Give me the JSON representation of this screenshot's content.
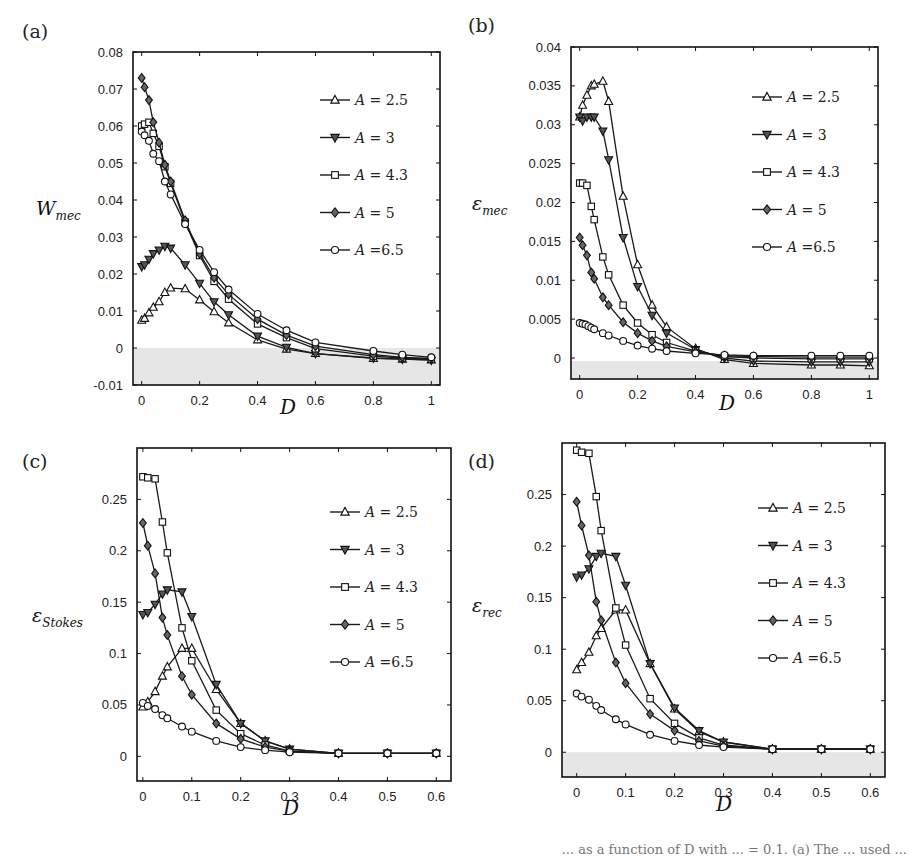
{
  "figure": {
    "caption_fragment": "... as a function of D with ... = 0.1. (a) The ... used ...",
    "legend": [
      {
        "label": "A = 2.5",
        "var": "A",
        "value": "= 2.5",
        "marker": "triangle-up",
        "fill": "#ffffff"
      },
      {
        "label": "A = 3",
        "var": "A",
        "value": "= 3",
        "marker": "triangle-down",
        "fill": "#555555"
      },
      {
        "label": "A = 4.3",
        "var": "A",
        "value": "= 4.3",
        "marker": "square",
        "fill": "#ffffff"
      },
      {
        "label": "A = 5",
        "var": "A",
        "value": "= 5",
        "marker": "diamond",
        "fill": "#666666"
      },
      {
        "label": "A =6.5",
        "var": "A",
        "value": "=6.5",
        "marker": "circle",
        "fill": "#ffffff"
      }
    ],
    "colors": {
      "line": "#1a1a1a",
      "shade": "#e6e6e6",
      "axis": "#111111"
    }
  },
  "chart_data": [
    {
      "panel": "(a)",
      "type": "line",
      "xlabel": "D",
      "ylabel": "W_mec",
      "ylabel_main": "W",
      "ylabel_sub": "mec",
      "xlim": [
        -0.03,
        1.03
      ],
      "ylim": [
        -0.01,
        0.08
      ],
      "xticks": [
        0,
        0.2,
        0.4,
        0.6,
        0.8,
        1
      ],
      "xtick_labels": [
        "0",
        "0.2",
        "0.4",
        "0.6",
        "0.8",
        "1"
      ],
      "yticks": [
        -0.01,
        0,
        0.01,
        0.02,
        0.03,
        0.04,
        0.05,
        0.06,
        0.07,
        0.08
      ],
      "ytick_labels": [
        "-0.01",
        "0",
        "0.01",
        "0.02",
        "0.03",
        "0.04",
        "0.05",
        "0.06",
        "0.07",
        "0.08"
      ],
      "shade_below": 0,
      "legend_position": "upper right",
      "box": {
        "x0": 133,
        "x1": 440,
        "y0": 52,
        "y1": 385
      },
      "series": [
        {
          "name": "A = 2.5",
          "x": [
            0,
            0.01,
            0.025,
            0.04,
            0.06,
            0.08,
            0.1,
            0.15,
            0.2,
            0.25,
            0.3,
            0.4,
            0.5,
            0.6,
            0.8,
            0.9,
            1.0
          ],
          "y": [
            0.0075,
            0.008,
            0.0095,
            0.011,
            0.0125,
            0.015,
            0.0162,
            0.016,
            0.013,
            0.0098,
            0.0068,
            0.0022,
            -0.0003,
            -0.0015,
            -0.0028,
            -0.003,
            -0.0032
          ]
        },
        {
          "name": "A = 3",
          "x": [
            0,
            0.01,
            0.025,
            0.04,
            0.06,
            0.08,
            0.1,
            0.15,
            0.2,
            0.25,
            0.3,
            0.4,
            0.5,
            0.6,
            0.8,
            0.9,
            1.0
          ],
          "y": [
            0.022,
            0.0225,
            0.024,
            0.0255,
            0.0265,
            0.0275,
            0.027,
            0.0225,
            0.0175,
            0.0125,
            0.009,
            0.0032,
            0.0002,
            -0.0015,
            -0.0027,
            -0.003,
            -0.0033
          ]
        },
        {
          "name": "A = 4.3",
          "x": [
            0,
            0.01,
            0.025,
            0.04,
            0.06,
            0.08,
            0.1,
            0.15,
            0.2,
            0.25,
            0.3,
            0.4,
            0.5,
            0.6,
            0.8,
            0.9,
            1.0
          ],
          "y": [
            0.06,
            0.0605,
            0.061,
            0.058,
            0.0545,
            0.049,
            0.0445,
            0.034,
            0.025,
            0.018,
            0.0132,
            0.0065,
            0.0028,
            -0.0002,
            -0.0022,
            -0.0027,
            -0.003
          ]
        },
        {
          "name": "A = 5",
          "x": [
            0,
            0.01,
            0.025,
            0.04,
            0.06,
            0.08,
            0.1,
            0.15,
            0.2,
            0.25,
            0.3,
            0.4,
            0.5,
            0.6,
            0.8,
            0.9,
            1.0
          ],
          "y": [
            0.073,
            0.0705,
            0.067,
            0.061,
            0.0555,
            0.0495,
            0.045,
            0.0345,
            0.0255,
            0.019,
            0.0145,
            0.0078,
            0.0035,
            0.0005,
            -0.0018,
            -0.0025,
            -0.0028
          ]
        },
        {
          "name": "A =6.5",
          "x": [
            0,
            0.01,
            0.025,
            0.04,
            0.06,
            0.08,
            0.1,
            0.15,
            0.2,
            0.25,
            0.3,
            0.4,
            0.5,
            0.6,
            0.8,
            0.9,
            1.0
          ],
          "y": [
            0.0585,
            0.0575,
            0.056,
            0.0525,
            0.0505,
            0.045,
            0.0415,
            0.0335,
            0.0265,
            0.0205,
            0.0158,
            0.0092,
            0.0048,
            0.0015,
            -0.0008,
            -0.0018,
            -0.0025
          ]
        }
      ]
    },
    {
      "panel": "(b)",
      "type": "line",
      "xlabel": "D",
      "ylabel": "ε_mec",
      "ylabel_main": "ε",
      "ylabel_sub": "mec",
      "xlim": [
        -0.03,
        1.03
      ],
      "ylim": [
        -0.0027,
        0.04
      ],
      "xticks": [
        0,
        0.2,
        0.4,
        0.6,
        0.8,
        1
      ],
      "xtick_labels": [
        "0",
        "0.2",
        "0.4",
        "0.6",
        "0.8",
        "1"
      ],
      "yticks": [
        0,
        0.005,
        0.01,
        0.015,
        0.02,
        0.025,
        0.03,
        0.035,
        0.04
      ],
      "ytick_labels": [
        "0",
        "0.005",
        "0.01",
        "0.015",
        "0.02",
        "0.025",
        "0.03",
        "0.035",
        "0.04"
      ],
      "shade_below": -0.0004,
      "legend_position": "upper right",
      "box": {
        "x0": 571,
        "x1": 878,
        "y0": 47,
        "y1": 379
      },
      "series": [
        {
          "name": "A = 2.5",
          "x": [
            0,
            0.01,
            0.025,
            0.04,
            0.05,
            0.08,
            0.1,
            0.15,
            0.2,
            0.25,
            0.3,
            0.4,
            0.5,
            0.6,
            0.8,
            0.9,
            1.0
          ],
          "y": [
            0.031,
            0.0325,
            0.0338,
            0.035,
            0.0352,
            0.0356,
            0.033,
            0.0208,
            0.012,
            0.0068,
            0.004,
            0.0012,
            -0.0002,
            -0.0007,
            -0.0009,
            -0.0009,
            -0.001
          ]
        },
        {
          "name": "A = 3",
          "x": [
            0,
            0.01,
            0.025,
            0.04,
            0.05,
            0.08,
            0.1,
            0.15,
            0.2,
            0.25,
            0.3,
            0.4,
            0.5,
            0.6,
            0.8,
            0.9,
            1.0
          ],
          "y": [
            0.031,
            0.0305,
            0.031,
            0.031,
            0.031,
            0.0292,
            0.0255,
            0.0155,
            0.0092,
            0.0055,
            0.0032,
            0.0011,
            0.0,
            -0.0004,
            -0.0005,
            -0.0005,
            -0.0005
          ]
        },
        {
          "name": "A = 4.3",
          "x": [
            0,
            0.01,
            0.025,
            0.04,
            0.05,
            0.08,
            0.1,
            0.15,
            0.2,
            0.25,
            0.3,
            0.4,
            0.5,
            0.6,
            0.8,
            0.9,
            1.0
          ],
          "y": [
            0.0225,
            0.0225,
            0.0222,
            0.0195,
            0.0178,
            0.013,
            0.0107,
            0.0068,
            0.0045,
            0.003,
            0.002,
            0.0009,
            0.0002,
            0.0,
            -0.0001,
            -0.0001,
            -0.0001
          ]
        },
        {
          "name": "A = 5",
          "x": [
            0,
            0.01,
            0.025,
            0.04,
            0.05,
            0.08,
            0.1,
            0.15,
            0.2,
            0.25,
            0.3,
            0.4,
            0.5,
            0.6,
            0.8,
            0.9,
            1.0
          ],
          "y": [
            0.0155,
            0.0145,
            0.0132,
            0.011,
            0.0102,
            0.0078,
            0.0068,
            0.0046,
            0.0032,
            0.0022,
            0.0015,
            0.0008,
            0.0003,
            0.0002,
            0.0001,
            0.0001,
            0.0001
          ]
        },
        {
          "name": "A =6.5",
          "x": [
            0,
            0.01,
            0.02,
            0.03,
            0.04,
            0.05,
            0.08,
            0.1,
            0.15,
            0.2,
            0.25,
            0.3,
            0.4,
            0.5,
            0.6,
            0.8,
            0.9,
            1.0
          ],
          "y": [
            0.0045,
            0.0044,
            0.0043,
            0.0041,
            0.0039,
            0.0037,
            0.0032,
            0.0029,
            0.0022,
            0.0016,
            0.0012,
            0.0009,
            0.0006,
            0.0004,
            0.0003,
            0.0003,
            0.0003,
            0.0003
          ]
        }
      ]
    },
    {
      "panel": "(c)",
      "type": "line",
      "xlabel": "D",
      "ylabel": "ε_Stokes",
      "ylabel_main": "ε",
      "ylabel_sub": "Stokes",
      "xlim": [
        -0.012,
        0.63
      ],
      "ylim": [
        -0.024,
        0.3
      ],
      "xticks": [
        0,
        0.1,
        0.2,
        0.3,
        0.4,
        0.5,
        0.6
      ],
      "xtick_labels": [
        "0",
        "0.1",
        "0.2",
        "0.3",
        "0.4",
        "0.5",
        "0.6"
      ],
      "yticks": [
        0,
        0.05,
        0.1,
        0.15,
        0.2,
        0.25
      ],
      "ytick_labels": [
        "0",
        "0.05",
        "0.1",
        "0.15",
        "0.2",
        "0.25"
      ],
      "shade_below": null,
      "legend_position": "upper right",
      "box": {
        "x0": 137,
        "x1": 451,
        "y0": 448,
        "y1": 781
      },
      "series": [
        {
          "name": "A = 2.5",
          "x": [
            0,
            0.01,
            0.025,
            0.04,
            0.05,
            0.08,
            0.1,
            0.15,
            0.2,
            0.25,
            0.3,
            0.4,
            0.5,
            0.6
          ],
          "y": [
            0.048,
            0.053,
            0.063,
            0.078,
            0.087,
            0.105,
            0.105,
            0.065,
            0.032,
            0.015,
            0.007,
            0.003,
            0.003,
            0.003
          ]
        },
        {
          "name": "A = 3",
          "x": [
            0,
            0.01,
            0.025,
            0.04,
            0.05,
            0.08,
            0.1,
            0.15,
            0.2,
            0.25,
            0.3,
            0.4,
            0.5,
            0.6
          ],
          "y": [
            0.138,
            0.14,
            0.148,
            0.158,
            0.162,
            0.16,
            0.136,
            0.07,
            0.032,
            0.015,
            0.007,
            0.003,
            0.003,
            0.003
          ]
        },
        {
          "name": "A = 4.3",
          "x": [
            0,
            0.01,
            0.025,
            0.04,
            0.05,
            0.08,
            0.1,
            0.15,
            0.2,
            0.25,
            0.3,
            0.4,
            0.5,
            0.6
          ],
          "y": [
            0.272,
            0.271,
            0.27,
            0.228,
            0.198,
            0.125,
            0.093,
            0.045,
            0.022,
            0.011,
            0.005,
            0.003,
            0.003,
            0.003
          ]
        },
        {
          "name": "A = 5",
          "x": [
            0,
            0.01,
            0.025,
            0.04,
            0.05,
            0.08,
            0.1,
            0.15,
            0.2,
            0.25,
            0.3,
            0.4,
            0.5,
            0.6
          ],
          "y": [
            0.227,
            0.205,
            0.178,
            0.135,
            0.118,
            0.078,
            0.06,
            0.032,
            0.017,
            0.009,
            0.005,
            0.003,
            0.003,
            0.003
          ]
        },
        {
          "name": "A =6.5",
          "x": [
            0,
            0.01,
            0.025,
            0.04,
            0.05,
            0.08,
            0.1,
            0.15,
            0.2,
            0.25,
            0.3,
            0.4,
            0.5,
            0.6
          ],
          "y": [
            0.052,
            0.049,
            0.046,
            0.04,
            0.037,
            0.029,
            0.024,
            0.015,
            0.009,
            0.006,
            0.004,
            0.003,
            0.003,
            0.003
          ]
        }
      ]
    },
    {
      "panel": "(d)",
      "type": "line",
      "xlabel": "D",
      "ylabel": "ε_rec",
      "ylabel_main": "ε",
      "ylabel_sub": "rec",
      "xlim": [
        -0.03,
        0.63
      ],
      "ylim": [
        -0.024,
        0.3
      ],
      "xticks": [
        0,
        0.1,
        0.2,
        0.3,
        0.4,
        0.5,
        0.6
      ],
      "xtick_labels": [
        "0",
        "0.1",
        "0.2",
        "0.3",
        "0.4",
        "0.5",
        "0.6"
      ],
      "yticks": [
        0,
        0.05,
        0.1,
        0.15,
        0.2,
        0.25
      ],
      "ytick_labels": [
        "0",
        "0.05",
        "0.1",
        "0.15",
        "0.2",
        "0.25"
      ],
      "shade_below": 0,
      "legend_position": "upper right",
      "box": {
        "x0": 562,
        "x1": 885,
        "y0": 443,
        "y1": 777
      },
      "series": [
        {
          "name": "A = 2.5",
          "x": [
            0,
            0.01,
            0.025,
            0.04,
            0.05,
            0.08,
            0.1,
            0.15,
            0.2,
            0.25,
            0.3,
            0.4,
            0.5,
            0.6
          ],
          "y": [
            0.08,
            0.087,
            0.097,
            0.113,
            0.12,
            0.138,
            0.138,
            0.086,
            0.042,
            0.02,
            0.01,
            0.003,
            0.003,
            0.003
          ]
        },
        {
          "name": "A = 3",
          "x": [
            0,
            0.01,
            0.025,
            0.04,
            0.05,
            0.08,
            0.1,
            0.15,
            0.2,
            0.25,
            0.3,
            0.4,
            0.5,
            0.6
          ],
          "y": [
            0.17,
            0.172,
            0.178,
            0.19,
            0.193,
            0.19,
            0.162,
            0.086,
            0.043,
            0.021,
            0.01,
            0.003,
            0.003,
            0.003
          ]
        },
        {
          "name": "A = 4.3",
          "x": [
            0,
            0.01,
            0.025,
            0.04,
            0.05,
            0.08,
            0.1,
            0.15,
            0.2,
            0.25,
            0.3,
            0.4,
            0.5,
            0.6
          ],
          "y": [
            0.293,
            0.291,
            0.29,
            0.248,
            0.215,
            0.14,
            0.104,
            0.052,
            0.028,
            0.014,
            0.007,
            0.003,
            0.003,
            0.003
          ]
        },
        {
          "name": "A = 5",
          "x": [
            0,
            0.01,
            0.025,
            0.04,
            0.05,
            0.08,
            0.1,
            0.15,
            0.2,
            0.25,
            0.3,
            0.4,
            0.5,
            0.6
          ],
          "y": [
            0.243,
            0.22,
            0.191,
            0.146,
            0.128,
            0.087,
            0.067,
            0.037,
            0.021,
            0.011,
            0.006,
            0.003,
            0.003,
            0.003
          ]
        },
        {
          "name": "A =6.5",
          "x": [
            0,
            0.01,
            0.025,
            0.04,
            0.05,
            0.08,
            0.1,
            0.15,
            0.2,
            0.25,
            0.3,
            0.4,
            0.5,
            0.6
          ],
          "y": [
            0.057,
            0.054,
            0.051,
            0.045,
            0.041,
            0.032,
            0.027,
            0.017,
            0.011,
            0.007,
            0.005,
            0.003,
            0.003,
            0.003
          ]
        }
      ]
    }
  ]
}
